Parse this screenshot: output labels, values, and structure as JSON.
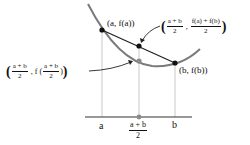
{
  "diagram": {
    "colors": {
      "curve": "#7a7a7a",
      "chord": "#222222",
      "guide": "#bbbbbb",
      "axis": "#333333",
      "point_black": "#111111",
      "point_gray": "#8a8a8a"
    },
    "labels": {
      "point_a": "(a, f(a))",
      "point_b": "(b, f(b))",
      "chord_mid": {
        "open": "(",
        "x_num": "a + b",
        "x_den": "2",
        "sep": ",",
        "y_num": "f(a) + f(b)",
        "y_den": "2",
        "close": ")"
      },
      "curve_mid": {
        "open": "(",
        "x_num": "a + b",
        "x_den": "2",
        "sep": ",",
        "fn": "f (",
        "arg_num": "a + b",
        "arg_den": "2",
        "fn_close": ")",
        "close": ")"
      },
      "axis_a": "a",
      "axis_b": "b",
      "axis_mid_num": "a + b",
      "axis_mid_den": "2"
    }
  }
}
